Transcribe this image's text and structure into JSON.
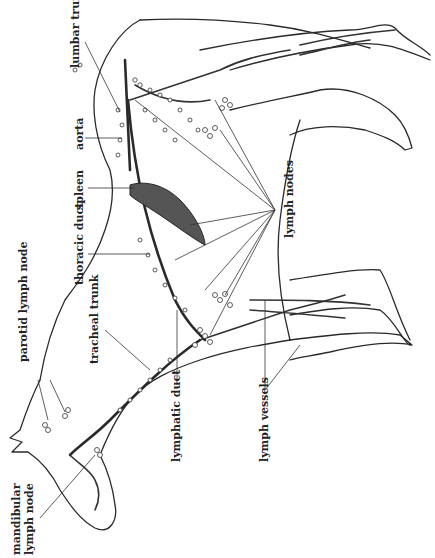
{
  "figure": {
    "orientation": "rotated 90 degrees counter-clockwise",
    "background_color": "#ffffff",
    "ink_color": "#2a2a2a"
  },
  "labels": {
    "lumbar_trunk": "lumbar trunk",
    "aorta": "aorta",
    "spleen": "spleen",
    "thoracic_duct": "thoracic duct",
    "parotid_lymph_node": "parotid lymph node",
    "tracheal_trunk": "tracheal trunk",
    "mandibular_lymph_node_line1": "mandibular",
    "mandibular_lymph_node_line2": "lymph node",
    "lymphatic_duct": "lymphatic duct",
    "lymph_vessels": "lymph vessels",
    "lymph_nodes": "lymph nodes"
  }
}
